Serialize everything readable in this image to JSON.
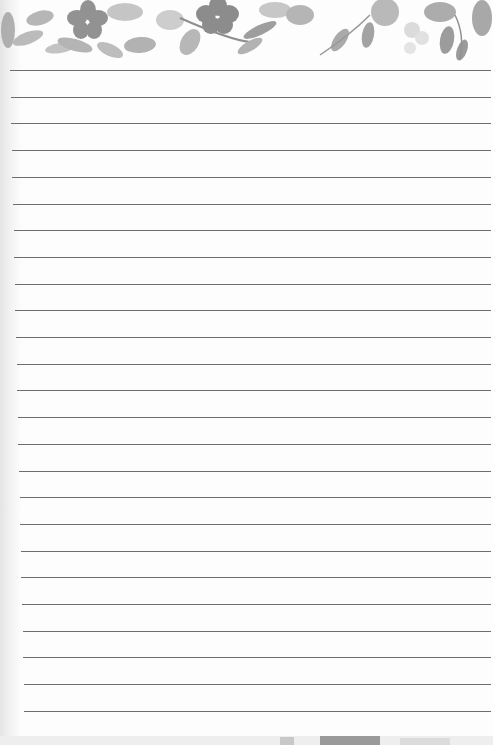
{
  "notepad": {
    "type": "lined-notepad-page",
    "header": {
      "motif": "watercolor-floral-border",
      "color": "#8a8a8a"
    },
    "lines": {
      "count": 25,
      "first_y": 70,
      "spacing": 26.7,
      "color": "#6e6e6e"
    },
    "paper_color": "#fdfdfd"
  }
}
